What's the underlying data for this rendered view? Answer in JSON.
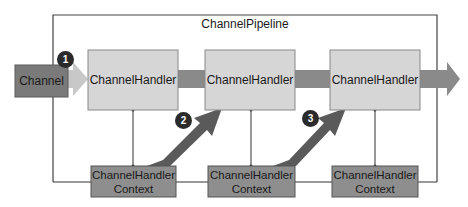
{
  "diagram": {
    "pipeline_title": "ChannelPipeline",
    "channel_label": "Channel",
    "handlers": [
      {
        "label": "ChannelHandler"
      },
      {
        "label": "ChannelHandler"
      },
      {
        "label": "ChannelHandler"
      }
    ],
    "contexts": [
      {
        "line1": "ChannelHandler",
        "line2": "Context"
      },
      {
        "line1": "ChannelHandler",
        "line2": "Context"
      },
      {
        "line1": "ChannelHandler",
        "line2": "Context"
      }
    ],
    "badges": [
      "1",
      "2",
      "3"
    ],
    "colors": {
      "channel_box": "#7a7a7a",
      "handler_box": "#d6d6d6",
      "context_box": "#8e8e8e",
      "arrow": "#8a8a8a",
      "arrow_light": "#c8c8c8",
      "diagonal_arrow": "#5a5a5a",
      "badge": "#2b2b2b",
      "line": "#333333"
    }
  }
}
